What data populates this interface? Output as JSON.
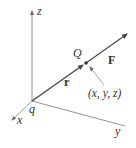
{
  "diagram": {
    "axes": {
      "z_label": "z",
      "x_label": "x",
      "y_label": "y"
    },
    "origin_charge_label": "q",
    "point_label": "Q",
    "position_vector_label": "r",
    "force_vector_label": "F",
    "coordinates_label": "(x, y, z)",
    "colors": {
      "axis": "#666666",
      "vector": "#444444",
      "text": "#333333",
      "background": "#ffffff"
    }
  }
}
